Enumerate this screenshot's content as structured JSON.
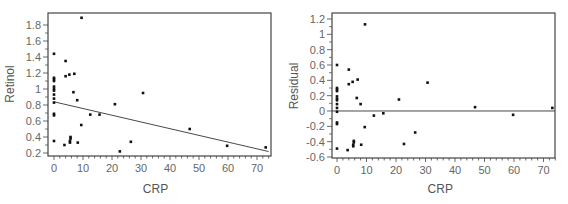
{
  "chart_data": [
    {
      "type": "scatter",
      "title": "",
      "xlabel": "CRP",
      "ylabel": "Retinol",
      "xlim": [
        -2,
        75
      ],
      "ylim": [
        0.18,
        2.0
      ],
      "xticks": [
        0,
        10,
        20,
        30,
        40,
        50,
        60,
        70
      ],
      "xtick_labels": [
        "0",
        "10",
        "20",
        "30",
        "40",
        "50",
        "60",
        "70"
      ],
      "yticks": [
        0.2,
        0.4,
        0.6,
        0.8,
        1.0,
        1.2,
        1.4,
        1.6,
        1.8
      ],
      "ytick_labels": [
        "0.2",
        "0.4",
        "0.6",
        "0.8",
        "1",
        "1.2",
        "1.4",
        "1.6",
        "1.8"
      ],
      "grid": false,
      "legend": null,
      "points": [
        {
          "x": 0,
          "y": 1.44
        },
        {
          "x": 0,
          "y": 1.14
        },
        {
          "x": 0,
          "y": 1.12
        },
        {
          "x": 0,
          "y": 1.1
        },
        {
          "x": 0,
          "y": 1.03
        },
        {
          "x": 0,
          "y": 1.0
        },
        {
          "x": 0,
          "y": 0.98
        },
        {
          "x": 0,
          "y": 0.93
        },
        {
          "x": 0,
          "y": 0.88
        },
        {
          "x": 0,
          "y": 0.83
        },
        {
          "x": 0,
          "y": 0.69
        },
        {
          "x": 0,
          "y": 0.67
        },
        {
          "x": 0,
          "y": 0.35
        },
        {
          "x": 3.6,
          "y": 0.3
        },
        {
          "x": 4,
          "y": 1.35
        },
        {
          "x": 4,
          "y": 1.16
        },
        {
          "x": 5.3,
          "y": 1.18
        },
        {
          "x": 5.5,
          "y": 0.33
        },
        {
          "x": 5.5,
          "y": 0.35
        },
        {
          "x": 5.7,
          "y": 0.38
        },
        {
          "x": 5.7,
          "y": 0.4
        },
        {
          "x": 6.7,
          "y": 0.96
        },
        {
          "x": 7,
          "y": 1.19
        },
        {
          "x": 8,
          "y": 0.86
        },
        {
          "x": 8.2,
          "y": 0.33
        },
        {
          "x": 9.4,
          "y": 0.55
        },
        {
          "x": 9.5,
          "y": 1.89
        },
        {
          "x": 12.5,
          "y": 0.68
        },
        {
          "x": 15.7,
          "y": 0.68
        },
        {
          "x": 21,
          "y": 0.81
        },
        {
          "x": 22.7,
          "y": 0.22
        },
        {
          "x": 26.5,
          "y": 0.34
        },
        {
          "x": 30.7,
          "y": 0.95
        },
        {
          "x": 46.8,
          "y": 0.5
        },
        {
          "x": 59.7,
          "y": 0.29
        },
        {
          "x": 73,
          "y": 0.27
        }
      ],
      "fit_line": {
        "intercept": 0.84,
        "slope": -0.0084,
        "x_range": [
          0,
          74
        ]
      }
    },
    {
      "type": "scatter",
      "title": "",
      "xlabel": "CRP",
      "ylabel": "Residual",
      "xlim": [
        -2,
        75
      ],
      "ylim": [
        -0.63,
        1.28
      ],
      "xticks": [
        0,
        10,
        20,
        30,
        40,
        50,
        60,
        70
      ],
      "xtick_labels": [
        "0",
        "10",
        "20",
        "30",
        "40",
        "50",
        "60",
        "70"
      ],
      "yticks": [
        -0.6,
        -0.4,
        -0.2,
        0,
        0.2,
        0.4,
        0.6,
        0.8,
        1.0,
        1.2
      ],
      "ytick_labels": [
        "-0.6",
        "-0.4",
        "-0.2",
        "0",
        "0.2",
        "0.4",
        "0.6",
        "0.8",
        "1",
        "1.2"
      ],
      "grid": false,
      "legend": null,
      "points": [
        {
          "x": 0,
          "y": 0.6
        },
        {
          "x": 0,
          "y": 0.3
        },
        {
          "x": 0,
          "y": 0.28
        },
        {
          "x": 0,
          "y": 0.26
        },
        {
          "x": 0,
          "y": 0.19
        },
        {
          "x": 0,
          "y": 0.16
        },
        {
          "x": 0,
          "y": 0.14
        },
        {
          "x": 0,
          "y": 0.09
        },
        {
          "x": 0,
          "y": 0.04
        },
        {
          "x": 0,
          "y": -0.01
        },
        {
          "x": 0,
          "y": -0.15
        },
        {
          "x": 0,
          "y": -0.17
        },
        {
          "x": 0,
          "y": -0.49
        },
        {
          "x": 3.6,
          "y": -0.51
        },
        {
          "x": 4,
          "y": 0.54
        },
        {
          "x": 4,
          "y": 0.35
        },
        {
          "x": 5.3,
          "y": 0.38
        },
        {
          "x": 5.5,
          "y": -0.46
        },
        {
          "x": 5.5,
          "y": -0.44
        },
        {
          "x": 5.7,
          "y": -0.41
        },
        {
          "x": 5.7,
          "y": -0.39
        },
        {
          "x": 6.7,
          "y": 0.17
        },
        {
          "x": 7,
          "y": 0.41
        },
        {
          "x": 8,
          "y": 0.09
        },
        {
          "x": 8.2,
          "y": -0.44
        },
        {
          "x": 9.4,
          "y": -0.21
        },
        {
          "x": 9.5,
          "y": 1.13
        },
        {
          "x": 12.5,
          "y": -0.06
        },
        {
          "x": 15.7,
          "y": -0.03
        },
        {
          "x": 21,
          "y": 0.15
        },
        {
          "x": 22.7,
          "y": -0.43
        },
        {
          "x": 26.5,
          "y": -0.28
        },
        {
          "x": 30.7,
          "y": 0.37
        },
        {
          "x": 46.8,
          "y": 0.05
        },
        {
          "x": 59.7,
          "y": -0.05
        },
        {
          "x": 73,
          "y": 0.04
        }
      ],
      "reference_line": {
        "y": 0
      }
    }
  ],
  "colors": {
    "frame": "#444444",
    "points": "#111111",
    "line": "#333333",
    "text": "#666666"
  }
}
